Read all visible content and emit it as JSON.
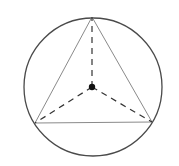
{
  "diagram": {
    "circle": {
      "cx": 93,
      "cy": 87,
      "r": 69,
      "stroke": "#4a4a4a"
    },
    "triangle": {
      "vertices": [
        [
          92,
          17
        ],
        [
          35,
          123
        ],
        [
          152,
          122
        ]
      ],
      "stroke": "#8a8a8a"
    },
    "center_point": {
      "x": 92,
      "y": 87,
      "r": 3.2,
      "fill": "#111111"
    },
    "dashed_segments": [
      {
        "from": [
          92,
          87
        ],
        "to": [
          92,
          17
        ]
      },
      {
        "from": [
          92,
          87
        ],
        "to": [
          35,
          123
        ]
      },
      {
        "from": [
          92,
          87
        ],
        "to": [
          152,
          122
        ]
      }
    ],
    "dash_color": "#333333"
  }
}
